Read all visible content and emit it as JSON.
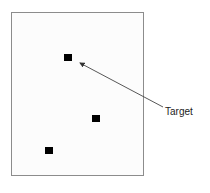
{
  "diagram": {
    "frame": {
      "x": 11,
      "y": 12,
      "width": 133,
      "height": 164,
      "border_color": "#8c8c8c"
    },
    "markers": [
      {
        "name": "target-marker",
        "x": 64,
        "y": 54
      },
      {
        "name": "marker-2",
        "x": 92,
        "y": 115
      },
      {
        "name": "marker-3",
        "x": 45,
        "y": 147
      }
    ],
    "annotation": {
      "label": "Target",
      "arrow_from": [
        163,
        107
      ],
      "arrow_to": [
        79,
        62
      ]
    }
  }
}
